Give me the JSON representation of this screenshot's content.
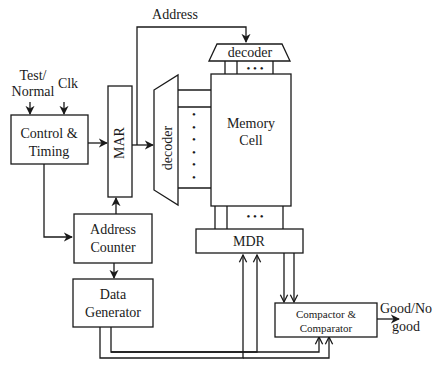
{
  "diagram": {
    "type": "block-diagram",
    "blocks": {
      "control_timing": {
        "line1": "Control &",
        "line2": "Timing"
      },
      "mar": {
        "label": "MAR"
      },
      "row_decoder": {
        "label": "decoder"
      },
      "col_decoder": {
        "label": "decoder"
      },
      "memory_cell": {
        "line1": "Memory",
        "line2": "Cell"
      },
      "mdr": {
        "label": "MDR"
      },
      "address_counter": {
        "line1": "Address",
        "line2": "Counter"
      },
      "data_generator": {
        "line1": "Data",
        "line2": "Generator"
      },
      "compactor_comparator": {
        "line1": "Compactor &",
        "line2": "Comparator"
      }
    },
    "signals": {
      "test_normal": {
        "line1": "Test/",
        "line2": "Normal"
      },
      "clk": {
        "label": "Clk"
      },
      "address": {
        "label": "Address"
      },
      "output": {
        "line1": "Good/No",
        "line2": "good"
      }
    },
    "dots": "• • •",
    "colors": {
      "stroke": "#1a1a1a",
      "background": "#ffffff"
    }
  }
}
